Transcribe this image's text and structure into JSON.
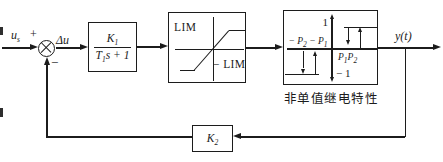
{
  "diagram": {
    "title_caption": "非单值继电特性",
    "colors": {
      "ink": "#1c1c1c",
      "bg": "#ffffff"
    },
    "input": {
      "signal_base": "u",
      "signal_sub": "s",
      "plus_sign": "+",
      "minus_sign": "−",
      "error_label": "Δu"
    },
    "gain_block": {
      "numerator_base": "K",
      "numerator_sub": "1",
      "denominator_t": "T",
      "denominator_t_sub": "1",
      "denominator_rest": "s + 1"
    },
    "limiter_block": {
      "upper_label": "LIM",
      "lower_label": "− LIM"
    },
    "relay_block": {
      "pos_level": "1",
      "neg_level": "− 1",
      "left_label_p2_base": "− P",
      "left_label_p2_sub": "2",
      "left_label_p1_base": "− P",
      "left_label_p1_sub": "1",
      "right_label_p1_base": "P",
      "right_label_p1_sub": "1",
      "right_label_p2_base": "P",
      "right_label_p2_sub": "2",
      "caption": "非单值继电特性"
    },
    "output": {
      "label": "y(t)"
    },
    "feedback_block": {
      "base": "K",
      "sub": "2"
    }
  }
}
